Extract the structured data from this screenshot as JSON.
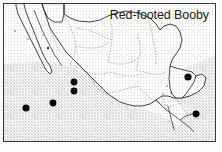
{
  "figure": {
    "title": "Red-footed Booby",
    "kind": "species-distribution-map",
    "region": "Mexico and Central America",
    "frame": {
      "x": 3,
      "y": 3,
      "width": 213,
      "height": 139,
      "border_color": "#3a3a3a"
    }
  },
  "legend": {
    "symbol_name": "filled-circle",
    "symbol_meaning": "occurrence record",
    "ocean_fill_name": "stipple-shading",
    "ocean_fill_color": "#e9e9e9",
    "land_fill_color": "#ffffff",
    "coastline_color": "#1c1c1c",
    "state_boundary_color": "#6b6b6b",
    "dot_color": "#000000"
  },
  "records": [
    {
      "id": "pacific-offshore-west",
      "cx": 22,
      "cy": 104,
      "r": 3.6
    },
    {
      "id": "pacific-offshore-mid",
      "cx": 49,
      "cy": 99,
      "r": 3.4
    },
    {
      "id": "pacific-coast-upper",
      "cx": 70,
      "cy": 78,
      "r": 3.4
    },
    {
      "id": "pacific-coast-lower",
      "cx": 70,
      "cy": 87,
      "r": 3.4
    },
    {
      "id": "caribbean-north",
      "cx": 184,
      "cy": 73,
      "r": 3.6
    },
    {
      "id": "caribbean-south",
      "cx": 192,
      "cy": 110,
      "r": 3.4
    },
    {
      "id": "baja-tiny-mark",
      "cx": 44,
      "cy": 44,
      "r": 1.2
    }
  ],
  "minor_marks": [
    {
      "id": "baja-speck-a",
      "cx": 11,
      "cy": 27,
      "r": 0.8
    },
    {
      "id": "baja-speck-b",
      "cx": 24,
      "cy": 35,
      "r": 0.7
    },
    {
      "id": "baja-speck-c",
      "cx": 39,
      "cy": 31,
      "r": 0.7
    },
    {
      "id": "yucatan-speck-a",
      "cx": 163,
      "cy": 82,
      "r": 0.8
    },
    {
      "id": "yucatan-speck-b",
      "cx": 159,
      "cy": 90,
      "r": 0.7
    },
    {
      "id": "gulf-speck",
      "cx": 167,
      "cy": 89,
      "r": 0.7
    }
  ]
}
